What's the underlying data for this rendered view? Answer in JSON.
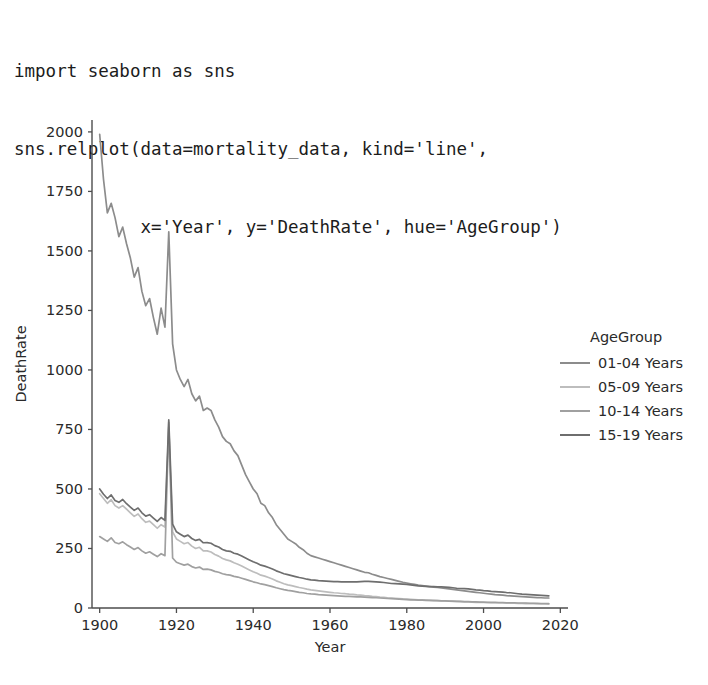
{
  "code": {
    "lines": [
      "import seaborn as sns",
      "sns.relplot(data=mortality_data, kind='line',",
      "            x='Year', y='DeathRate', hue='AgeGroup')"
    ]
  },
  "legend": {
    "title": "AgeGroup",
    "entries": [
      {
        "label": "01-04 Years",
        "color": "#8c8c8c"
      },
      {
        "label": "05-09 Years",
        "color": "#bdbdbd"
      },
      {
        "label": "10-14 Years",
        "color": "#a0a0a0"
      },
      {
        "label": "15-19 Years",
        "color": "#6e6e6e"
      }
    ]
  },
  "axes": {
    "xlabel": "Year",
    "ylabel": "DeathRate",
    "xticks": [
      "1900",
      "1920",
      "1940",
      "1960",
      "1980",
      "2000",
      "2020"
    ],
    "yticks": [
      "0",
      "250",
      "500",
      "750",
      "1000",
      "1250",
      "1500",
      "1750",
      "2000"
    ]
  },
  "chart_data": {
    "type": "line",
    "title": "",
    "xlabel": "Year",
    "ylabel": "DeathRate",
    "xlim": [
      1898,
      2022
    ],
    "ylim": [
      0,
      2050
    ],
    "xticks": [
      1900,
      1920,
      1940,
      1960,
      1980,
      2000,
      2020
    ],
    "yticks": [
      0,
      250,
      500,
      750,
      1000,
      1250,
      1500,
      1750,
      2000
    ],
    "grid": false,
    "legend_position": "right",
    "legend_title": "AgeGroup",
    "x": [
      1900,
      1901,
      1902,
      1903,
      1904,
      1905,
      1906,
      1907,
      1908,
      1909,
      1910,
      1911,
      1912,
      1913,
      1914,
      1915,
      1916,
      1917,
      1918,
      1919,
      1920,
      1921,
      1922,
      1923,
      1924,
      1925,
      1926,
      1927,
      1928,
      1929,
      1930,
      1931,
      1932,
      1933,
      1934,
      1935,
      1936,
      1937,
      1938,
      1939,
      1940,
      1941,
      1942,
      1943,
      1944,
      1945,
      1946,
      1947,
      1948,
      1949,
      1950,
      1951,
      1952,
      1953,
      1954,
      1955,
      1956,
      1957,
      1958,
      1959,
      1960,
      1961,
      1962,
      1963,
      1964,
      1965,
      1966,
      1967,
      1968,
      1969,
      1970,
      1971,
      1972,
      1973,
      1974,
      1975,
      1976,
      1977,
      1978,
      1979,
      1980,
      1981,
      1982,
      1983,
      1984,
      1985,
      1986,
      1987,
      1988,
      1989,
      1990,
      1991,
      1992,
      1993,
      1994,
      1995,
      1996,
      1997,
      1998,
      1999,
      2000,
      2001,
      2002,
      2003,
      2004,
      2005,
      2006,
      2007,
      2008,
      2009,
      2010,
      2011,
      2012,
      2013,
      2014,
      2015,
      2016,
      2017
    ],
    "series": [
      {
        "name": "01-04 Years",
        "color": "#8c8c8c",
        "values": [
          1990,
          1800,
          1660,
          1700,
          1640,
          1560,
          1600,
          1530,
          1470,
          1390,
          1430,
          1330,
          1270,
          1300,
          1220,
          1150,
          1260,
          1180,
          1580,
          1110,
          1000,
          960,
          930,
          960,
          900,
          870,
          890,
          830,
          840,
          830,
          790,
          760,
          720,
          700,
          690,
          660,
          640,
          600,
          560,
          530,
          500,
          480,
          440,
          430,
          400,
          380,
          350,
          330,
          310,
          290,
          280,
          270,
          255,
          245,
          230,
          220,
          215,
          210,
          205,
          200,
          195,
          190,
          185,
          180,
          175,
          170,
          165,
          160,
          155,
          150,
          148,
          142,
          137,
          132,
          128,
          124,
          120,
          116,
          112,
          108,
          105,
          102,
          99,
          96,
          94,
          92,
          90,
          88,
          86,
          84,
          82,
          80,
          78,
          76,
          74,
          72,
          70,
          68,
          66,
          64,
          62,
          60,
          58,
          56,
          55,
          54,
          52,
          51,
          50,
          49,
          48,
          47,
          46,
          45,
          44,
          43,
          42,
          42
        ]
      },
      {
        "name": "05-09 Years",
        "color": "#bdbdbd",
        "values": [
          480,
          460,
          440,
          455,
          430,
          420,
          430,
          415,
          400,
          385,
          395,
          375,
          360,
          365,
          350,
          335,
          350,
          340,
          760,
          320,
          290,
          280,
          270,
          275,
          260,
          250,
          255,
          240,
          240,
          235,
          225,
          218,
          208,
          202,
          198,
          190,
          184,
          176,
          168,
          160,
          152,
          146,
          138,
          134,
          128,
          122,
          114,
          108,
          102,
          97,
          94,
          90,
          86,
          83,
          79,
          76,
          74,
          72,
          70,
          68,
          66,
          64,
          63,
          61,
          60,
          58,
          57,
          55,
          54,
          52,
          51,
          49,
          48,
          46,
          45,
          43,
          42,
          41,
          40,
          38,
          37,
          36,
          35,
          34,
          34,
          33,
          32,
          32,
          31,
          30,
          30,
          29,
          28,
          28,
          27,
          26,
          26,
          25,
          24,
          24,
          23,
          23,
          22,
          22,
          21,
          21,
          20,
          20,
          20,
          19,
          19,
          18,
          18,
          18,
          17,
          17,
          17,
          16
        ]
      },
      {
        "name": "10-14 Years",
        "color": "#a0a0a0",
        "values": [
          300,
          290,
          280,
          295,
          275,
          270,
          278,
          266,
          256,
          246,
          254,
          240,
          230,
          236,
          226,
          216,
          228,
          220,
          780,
          210,
          192,
          186,
          180,
          184,
          174,
          168,
          172,
          162,
          163,
          160,
          154,
          150,
          144,
          140,
          138,
          133,
          130,
          125,
          120,
          115,
          110,
          106,
          101,
          98,
          94,
          90,
          85,
          81,
          77,
          74,
          72,
          69,
          66,
          64,
          61,
          59,
          58,
          56,
          55,
          54,
          53,
          52,
          51,
          50,
          49,
          49,
          48,
          47,
          47,
          46,
          45,
          44,
          43,
          42,
          41,
          40,
          39,
          38,
          37,
          36,
          35,
          34,
          34,
          33,
          33,
          32,
          32,
          31,
          31,
          30,
          30,
          29,
          29,
          28,
          28,
          27,
          27,
          26,
          26,
          25,
          25,
          24,
          24,
          24,
          23,
          23,
          22,
          22,
          22,
          21,
          21,
          21,
          20,
          20,
          20,
          19,
          19,
          19
        ]
      },
      {
        "name": "15-19 Years",
        "color": "#6e6e6e",
        "values": [
          500,
          478,
          460,
          475,
          452,
          444,
          456,
          438,
          424,
          410,
          420,
          400,
          386,
          392,
          378,
          364,
          380,
          368,
          790,
          352,
          320,
          310,
          300,
          306,
          292,
          284,
          288,
          274,
          275,
          272,
          262,
          256,
          246,
          240,
          238,
          230,
          226,
          218,
          210,
          202,
          194,
          188,
          180,
          176,
          170,
          164,
          156,
          150,
          144,
          140,
          136,
          132,
          128,
          125,
          121,
          118,
          117,
          115,
          114,
          113,
          112,
          111,
          111,
          110,
          110,
          110,
          110,
          110,
          111,
          112,
          112,
          111,
          110,
          109,
          107,
          105,
          103,
          102,
          101,
          100,
          99,
          97,
          95,
          93,
          92,
          91,
          90,
          90,
          89,
          89,
          88,
          87,
          85,
          83,
          82,
          81,
          80,
          78,
          76,
          75,
          73,
          72,
          70,
          69,
          68,
          67,
          65,
          64,
          62,
          60,
          58,
          57,
          56,
          55,
          54,
          53,
          52,
          51
        ]
      }
    ]
  }
}
